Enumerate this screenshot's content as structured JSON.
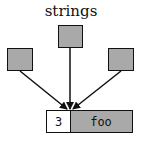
{
  "title": "strings",
  "record": {
    "length": "3",
    "value": "foo"
  },
  "colors": {
    "box_fill": "#a9a9a9",
    "stroke": "#111111",
    "length_fill": "#ffffff"
  },
  "pointers": [
    "left-pointer",
    "center-pointer",
    "right-pointer"
  ]
}
